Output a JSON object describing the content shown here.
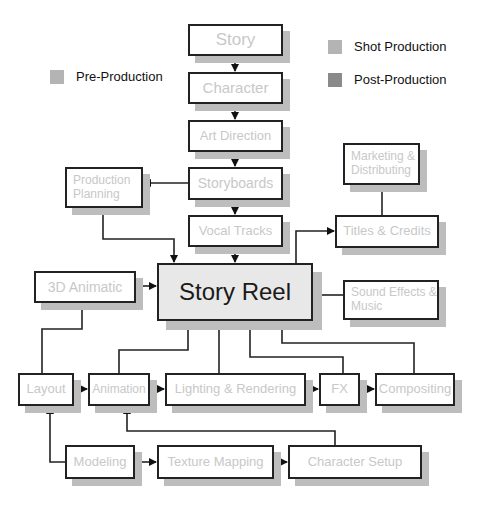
{
  "legend": [
    {
      "label": "Shot Production",
      "color": "#b4b4b4"
    },
    {
      "label": "Post-Production",
      "color": "#8a8a8a"
    },
    {
      "label": "Pre-Production",
      "color": "#b4b4b4"
    }
  ],
  "nodes": {
    "story": "Story",
    "character": "Character",
    "art_direction": "Art Direction",
    "storyboards": "Storyboards",
    "vocal_tracks": "Vocal Tracks",
    "production_planning": "Production Planning",
    "marketing": "Marketing & Distributing",
    "titles": "Titles & Credits",
    "animatic": "3D Animatic",
    "story_reel": "Story Reel",
    "sound": "Sound Effects & Music",
    "layout": "Layout",
    "animation": "Animation",
    "lighting": "Lighting & Rendering",
    "fx": "FX",
    "compositing": "Compositing",
    "modeling": "Modeling",
    "texture": "Texture Mapping",
    "character_setup": "Character Setup"
  }
}
